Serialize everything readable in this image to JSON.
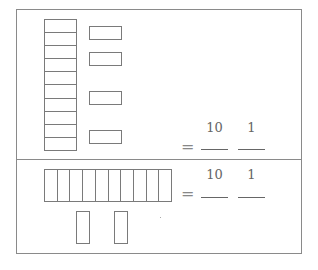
{
  "problems": [
    {
      "id": "top",
      "tens_rods": 1,
      "rod_cells": 10,
      "ones_units": 4,
      "equals": "=",
      "column_labels": [
        "10",
        "1"
      ],
      "answer_blanks": [
        "",
        ""
      ]
    },
    {
      "id": "bottom",
      "tens_rods": 1,
      "rod_cells": 10,
      "ones_units": 2,
      "equals": "=",
      "column_labels": [
        "10",
        "1"
      ],
      "answer_blanks": [
        "",
        ""
      ]
    }
  ],
  "colors": {
    "line": "#7a7a7a",
    "frame": "#8a8a8a",
    "text": "#666666"
  }
}
